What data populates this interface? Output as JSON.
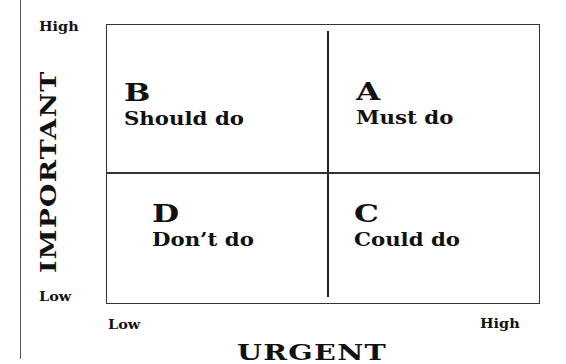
{
  "diagram": {
    "type": "priority-matrix",
    "y_axis": {
      "title": "IMPORTANT",
      "high_label": "High",
      "low_label": "Low"
    },
    "x_axis": {
      "title": "URGENT",
      "low_label": "Low",
      "high_label": "High"
    },
    "quadrants": {
      "top_left": {
        "letter": "B",
        "action": "Should do"
      },
      "top_right": {
        "letter": "A",
        "action": "Must do"
      },
      "bottom_left": {
        "letter": "D",
        "action": "Don’t do"
      },
      "bottom_right": {
        "letter": "C",
        "action": "Could do"
      }
    }
  }
}
